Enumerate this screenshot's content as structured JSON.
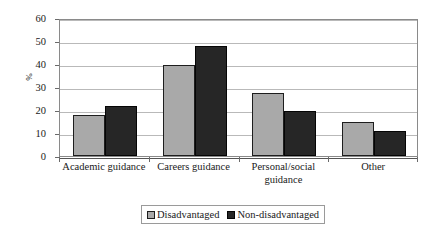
{
  "chart_data": {
    "type": "bar",
    "title": "",
    "subtitle": "",
    "xlabel": "",
    "ylabel": "%",
    "ylim": [
      0,
      60
    ],
    "ytick_step": 10,
    "yticks": [
      60,
      50,
      40,
      30,
      20,
      10,
      0
    ],
    "grid": true,
    "grid_axis": "y",
    "legend_position": "bottom-center",
    "categories": [
      "Academic guidance",
      "Careers guidance",
      "Personal/social guidance",
      "Other"
    ],
    "category_lines": [
      [
        "Academic guidance"
      ],
      [
        "Careers guidance"
      ],
      [
        "Personal/social",
        "guidance"
      ],
      [
        "Other"
      ]
    ],
    "series": [
      {
        "name": "Disadvantaged",
        "color": "#a9a9a9",
        "values": [
          18.0,
          39.6,
          27.2,
          14.8
        ]
      },
      {
        "name": "Non-disadvantaged",
        "color": "#262626",
        "values": [
          21.7,
          48.0,
          19.5,
          10.8
        ]
      }
    ]
  },
  "legend": {
    "items": [
      {
        "label": "Disadvantaged",
        "swatch": "series-0"
      },
      {
        "label": "Non-disadvantaged",
        "swatch": "series-1"
      }
    ]
  },
  "colors": {
    "series_disadvantaged": "#a9a9a9",
    "series_non_disadvantaged": "#262626",
    "gridline": "#b9b9b9",
    "axis": "#8a8a8a",
    "background": "#ffffff"
  }
}
